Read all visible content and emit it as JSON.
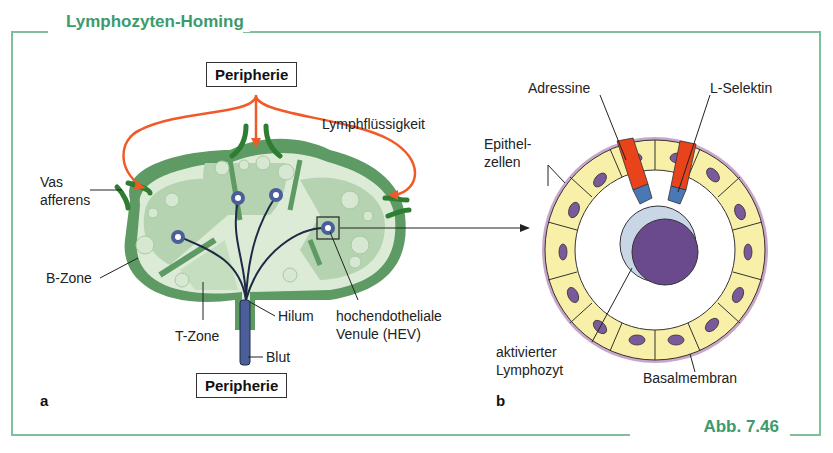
{
  "figure": {
    "title": "Lymphozyten-Homing",
    "caption": "Abb. 7.46",
    "frame_color": "#3e9a6a"
  },
  "panel_a": {
    "label": "a",
    "top_box": "Peripherie",
    "bottom_box": "Peripherie",
    "labels": {
      "lymph": "Lymphflüssigkeit",
      "vas_afferens_1": "Vas",
      "vas_afferens_2": "afferens",
      "b_zone": "B-Zone",
      "t_zone": "T-Zone",
      "hilum": "Hilum",
      "blut": "Blut",
      "hev_1": "hochendotheliale",
      "hev_2": "Venule (HEV)"
    },
    "colors": {
      "capsule": "#5e9a63",
      "dark_green": "#2e7d32",
      "b_zone_fill": "#b5d3b0",
      "light_fill": "#dcebd6",
      "vessel": "#4a5f9a",
      "arrow": "#f05a28"
    }
  },
  "panel_b": {
    "label": "b",
    "labels": {
      "adressine": "Adressine",
      "l_selektin": "L-Selektin",
      "epithel_1": "Epithel-",
      "epithel_2": "zellen",
      "lymphozyt_1": "aktivierter",
      "lymphozyt_2": "Lymphozyt",
      "basalmembran": "Basalmembran"
    },
    "colors": {
      "cell_fill": "#f8f0a8",
      "nucleus": "#7a5a9a",
      "membrane": "#c9a6c9",
      "adressin_red": "#e8431a",
      "binding_blue": "#4a78b4",
      "lymphocyte": "#6a4a8c",
      "lymphocyte_halo": "#c8d6e6"
    }
  }
}
